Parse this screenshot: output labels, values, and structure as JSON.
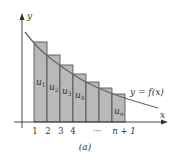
{
  "diagram": {
    "caption": "(a)",
    "axes": {
      "x_label": "x",
      "y_label": "y"
    },
    "curve_label": "y = f(x)",
    "tick_labels": [
      "1",
      "2",
      "3",
      "4",
      "···",
      "n + 1"
    ],
    "rect_labels": [
      {
        "base": "u",
        "sub": "1"
      },
      {
        "base": "u",
        "sub": "2"
      },
      {
        "base": "u",
        "sub": "3"
      },
      {
        "base": "u",
        "sub": "4"
      },
      {
        "base": "u",
        "sub": "n"
      }
    ],
    "colors": {
      "rect_fill": "#b9b9b9",
      "rect_stroke": "#444444",
      "curve": "#666666",
      "axis": "#333333"
    }
  }
}
